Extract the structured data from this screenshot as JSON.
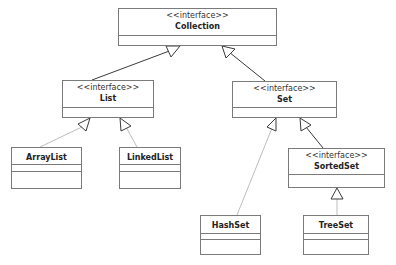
{
  "diagram": {
    "type": "UML class diagram",
    "nodes": {
      "collection": {
        "stereotype": "<<interface>>",
        "name": "Collection"
      },
      "list": {
        "stereotype": "<<interface>>",
        "name": "List"
      },
      "set": {
        "stereotype": "<<interface>>",
        "name": "Set"
      },
      "sortedset": {
        "stereotype": "<<interface>>",
        "name": "SortedSet"
      },
      "arraylist": {
        "name": "ArrayList"
      },
      "linkedlist": {
        "name": "LinkedList"
      },
      "hashset": {
        "name": "HashSet"
      },
      "treeset": {
        "name": "TreeSet"
      }
    },
    "edges": [
      {
        "from": "List",
        "to": "Collection",
        "kind": "generalization"
      },
      {
        "from": "Set",
        "to": "Collection",
        "kind": "generalization"
      },
      {
        "from": "ArrayList",
        "to": "List",
        "kind": "realization"
      },
      {
        "from": "LinkedList",
        "to": "List",
        "kind": "realization"
      },
      {
        "from": "HashSet",
        "to": "Set",
        "kind": "realization"
      },
      {
        "from": "SortedSet",
        "to": "Set",
        "kind": "generalization"
      },
      {
        "from": "TreeSet",
        "to": "SortedSet",
        "kind": "realization"
      }
    ],
    "colors": {
      "line_dark": "#3a3a3a",
      "line_light": "#bdbdbd",
      "border": "#7a7a7a"
    }
  }
}
